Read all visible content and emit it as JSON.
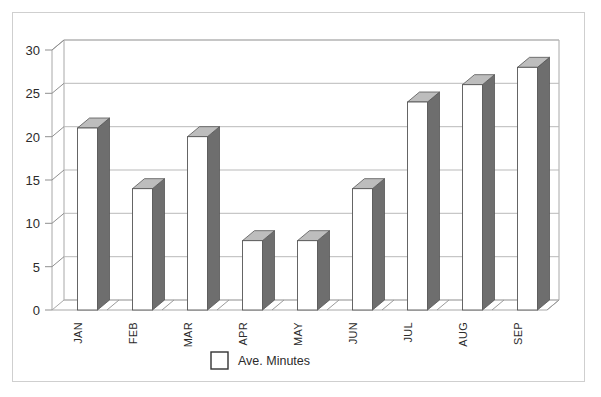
{
  "chart_data": {
    "type": "bar",
    "title": "",
    "subtitle": "",
    "xlabel": "",
    "ylabel": "",
    "categories": [
      "JAN",
      "FEB",
      "MAR",
      "APR",
      "MAY",
      "JUN",
      "JUL",
      "AUG",
      "SEP"
    ],
    "values": [
      21,
      14,
      20,
      8,
      8,
      14,
      24,
      26,
      28
    ],
    "series": [
      {
        "name": "Ave. Minutes",
        "values": [
          21,
          14,
          20,
          8,
          8,
          14,
          24,
          26,
          28
        ]
      }
    ],
    "ylim": [
      0,
      30
    ],
    "ytick_labels": [
      "0",
      "5",
      "10",
      "15",
      "20",
      "25",
      "30"
    ],
    "ytick_values": [
      0,
      5,
      10,
      15,
      20,
      25,
      30
    ],
    "grid": true,
    "grid_axis": "y",
    "legend": {
      "position": "bottom",
      "entries": [
        {
          "label": "Ave. Minutes",
          "marker": "white-square",
          "face_color": "#ffffff",
          "edge_color": "#333333"
        }
      ]
    },
    "style": {
      "three_d": true,
      "bar_face_color": "#ffffff",
      "bar_side_color": "#6e6e6e",
      "bar_top_color": "#bdbdbd",
      "bar_edge_color": "#555555",
      "plot_background": "#ffffff",
      "grid_color": "#b9b9b9",
      "frame_color": "#cfcfcf",
      "text_color": "#2b2b2b"
    },
    "category_label_rotation": -90
  },
  "legend": {
    "marker_name": "legend-swatch",
    "text": "Ave. Minutes"
  }
}
